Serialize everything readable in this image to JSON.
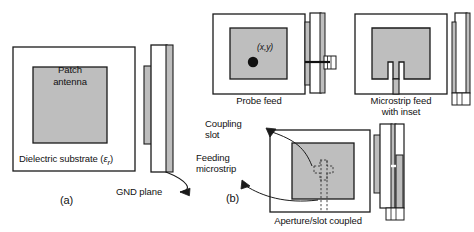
{
  "figure": {
    "background_color": "#ffffff",
    "outline_color": "#1a1a1a",
    "metal_fill_color": "#bebebe",
    "substrate_fill_color": "#ffffff"
  },
  "labels": {
    "patch_antenna_line1": "Patch",
    "patch_antenna_line2": "antenna",
    "dielectric_substrate": "Dielectric substrate (εr)",
    "dielectric_substrate_plain": "Dielectric substrate",
    "dielectric_substrate_symbol": "ε",
    "dielectric_substrate_subscript": "r",
    "gnd_plane": "GND plane",
    "panel_a": "(a)",
    "panel_b": "(b)",
    "probe_feed": "Probe feed",
    "probe_coordinates": "(x,y)",
    "microstrip_feed_line1": "Microstrip feed",
    "microstrip_feed_line2": "with inset",
    "coupling_slot_line1": "Coupling",
    "coupling_slot_line2": "slot",
    "feeding_microstrip_line1": "Feeding",
    "feeding_microstrip_line2": "microstrip",
    "aperture_slot_coupled": "Aperture/slot coupled"
  },
  "panels": [
    {
      "id": "basic-patch",
      "letter": "(a)",
      "caption": "",
      "views": [
        "top",
        "side"
      ],
      "annotations": [
        "Patch antenna",
        "Dielectric substrate (εr)",
        "GND plane"
      ]
    },
    {
      "id": "probe-feed",
      "letter": "",
      "caption": "Probe feed",
      "views": [
        "top",
        "side"
      ],
      "annotations": [
        "(x,y)"
      ]
    },
    {
      "id": "microstrip-feed-inset",
      "letter": "",
      "caption": "Microstrip feed with inset",
      "views": [
        "top",
        "side"
      ],
      "annotations": []
    },
    {
      "id": "aperture-slot-coupled",
      "letter": "(b)",
      "caption": "Aperture/slot coupled",
      "views": [
        "top",
        "side"
      ],
      "annotations": [
        "Coupling slot",
        "Feeding microstrip"
      ]
    }
  ]
}
